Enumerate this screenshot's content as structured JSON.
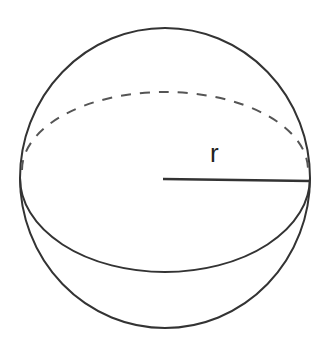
{
  "diagram": {
    "type": "sphere",
    "radius_label": "r",
    "stroke_color": "#333333",
    "background": "#ffffff"
  }
}
